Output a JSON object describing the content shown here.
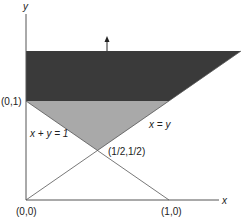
{
  "diagram": {
    "axes": {
      "x_label": "x",
      "y_label": "y"
    },
    "points": {
      "origin": "(0,0)",
      "x_one": "(1,0)",
      "y_one": "(0,1)",
      "intersection": "(1/2,1/2)"
    },
    "lines": {
      "anti_diagonal": "x + y = 1",
      "diagonal": "x = y"
    },
    "regions": [
      {
        "name": "dark-region",
        "description": "y >= 1, below x = y extension",
        "color": "#3a3a3a"
      },
      {
        "name": "gray-region",
        "description": "triangle between x + y = 1, x = y and y = 1",
        "color": "#a9a9a9"
      }
    ],
    "arrow": {
      "direction": "up"
    },
    "colors": {
      "axis": "#555555",
      "dark_fill": "#3a3a3a",
      "gray_fill": "#a9a9a9",
      "line": "#555555"
    }
  }
}
